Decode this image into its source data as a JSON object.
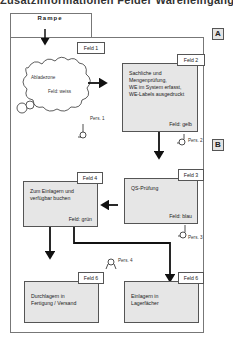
{
  "header": {
    "cut_text": "Zusatzinformationen   Felder   Wareneingang"
  },
  "badges": {
    "a": "A",
    "b": "B"
  },
  "rampe": {
    "label": "Rampe"
  },
  "fields": [
    {
      "tag": "Feld 1",
      "text": "Abladezone",
      "color": "Feld: weiss",
      "person": "Pers. 1"
    },
    {
      "tag": "Feld 2",
      "text": "Sachliche und Mengenprüfung, WE im System erfasst, WE-Labels ausgedruckt",
      "color": "Feld: gelb",
      "person": "Pers. 2"
    },
    {
      "tag": "Feld 3",
      "text": "QS-Prüfung",
      "color": "Feld: blau",
      "person": "Pers. 3"
    },
    {
      "tag": "Feld 4",
      "text": "Zum Einlagern und verfügbar buchen",
      "color": "Feld: grün",
      "person": "Pers. 4"
    },
    {
      "tag": "Feld 6",
      "text": "Durchlagern in Fertigung / Versand",
      "color": ""
    },
    {
      "tag": "Feld 6",
      "text": "Einlagern in Lagerfächer",
      "color": ""
    }
  ],
  "feld2_lines": [
    "Sachliche und",
    "Mengenprüfung,",
    "WE im System erfasst,",
    "WE-Labels ausgedruckt"
  ],
  "feld4_lines": [
    "Zum Einlagern und",
    "verfügbar buchen"
  ],
  "feld5_lines": [
    "Durchlagern in",
    "Fertigung / Versand"
  ],
  "feld6_lines": [
    "Einlagern in",
    "Lagerfächer"
  ]
}
